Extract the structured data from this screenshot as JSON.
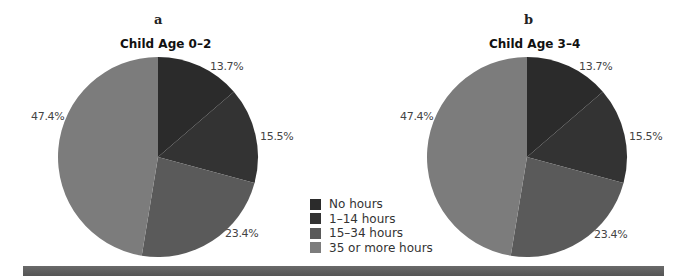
{
  "colors": {
    "no_hours": "#2b2b2b",
    "h1_14": "#333333",
    "h15_34": "#5a5a5a",
    "h35": "#7c7c7c"
  },
  "panels": [
    {
      "letter": "a",
      "title": "Child Age 0–2",
      "labels": {
        "no_hours": "13.7%",
        "h1_14": "15.5%",
        "h15_34": "23.4%",
        "h35": "47.4%"
      }
    },
    {
      "letter": "b",
      "title": "Child Age 3–4",
      "labels": {
        "no_hours": "13.7%",
        "h1_14": "15.5%",
        "h15_34": "23.4%",
        "h35": "47.4%"
      }
    }
  ],
  "legend": [
    {
      "label": "No hours",
      "color": "#2b2b2b"
    },
    {
      "label": "1–14 hours",
      "color": "#333333"
    },
    {
      "label": "15–34 hours",
      "color": "#5a5a5a"
    },
    {
      "label": "35 or more hours",
      "color": "#7c7c7c"
    }
  ],
  "chart_data": [
    {
      "type": "pie",
      "title": "Child Age 0–2",
      "panel": "a",
      "categories": [
        "No hours",
        "1–14 hours",
        "15–34 hours",
        "35 or more hours"
      ],
      "values": [
        13.7,
        15.5,
        23.4,
        47.4
      ],
      "legend_position": "center-bottom"
    },
    {
      "type": "pie",
      "title": "Child Age 3–4",
      "panel": "b",
      "categories": [
        "No hours",
        "1–14 hours",
        "15–34 hours",
        "35 or more hours"
      ],
      "values": [
        13.7,
        15.5,
        23.4,
        47.4
      ],
      "legend_position": "center-bottom"
    }
  ]
}
